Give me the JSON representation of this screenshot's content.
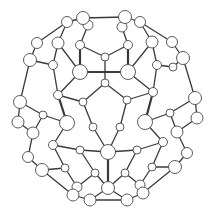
{
  "diagram": {
    "colors": {
      "background": "#ffffff",
      "bond": "#3a3a3a",
      "atom_fill": "#ffffff",
      "atom_stroke": "#4a4a4a"
    },
    "atoms": [
      [
        83,
        18,
        6.5
      ],
      [
        125,
        17,
        6.5
      ],
      [
        67,
        22,
        5.5
      ],
      [
        140,
        22,
        5.5
      ],
      [
        88,
        25,
        5
      ],
      [
        122,
        27,
        5
      ],
      [
        37,
        43,
        5.5
      ],
      [
        58,
        43,
        6
      ],
      [
        152,
        42,
        6
      ],
      [
        172,
        42,
        5.5
      ],
      [
        80,
        45,
        4.5
      ],
      [
        128,
        45,
        4.5
      ],
      [
        30,
        60,
        6.5
      ],
      [
        183,
        58,
        6.5
      ],
      [
        105,
        57,
        4
      ],
      [
        53,
        65,
        4.5
      ],
      [
        157,
        65,
        4.5
      ],
      [
        173,
        67,
        4
      ],
      [
        80,
        72,
        7.5
      ],
      [
        128,
        72,
        7.5
      ],
      [
        105,
        83,
        4
      ],
      [
        58,
        95,
        4.5
      ],
      [
        153,
        92,
        4.5
      ],
      [
        20,
        102,
        6.5
      ],
      [
        195,
        98,
        6.5
      ],
      [
        83,
        102,
        4
      ],
      [
        127,
        100,
        4
      ],
      [
        43,
        115,
        4
      ],
      [
        170,
        113,
        4
      ],
      [
        18,
        122,
        6
      ],
      [
        197,
        118,
        6
      ],
      [
        67,
        123,
        7.5
      ],
      [
        145,
        122,
        7.5
      ],
      [
        93,
        127,
        4
      ],
      [
        120,
        127,
        4
      ],
      [
        33,
        133,
        6
      ],
      [
        177,
        132,
        6
      ],
      [
        53,
        145,
        4.5
      ],
      [
        163,
        142,
        4.5
      ],
      [
        80,
        150,
        4
      ],
      [
        137,
        150,
        4
      ],
      [
        108,
        152,
        7.5
      ],
      [
        28,
        157,
        5.5
      ],
      [
        187,
        153,
        5.5
      ],
      [
        42,
        170,
        6.5
      ],
      [
        175,
        167,
        6.5
      ],
      [
        65,
        168,
        4
      ],
      [
        152,
        167,
        4
      ],
      [
        95,
        173,
        4
      ],
      [
        125,
        173,
        4
      ],
      [
        77,
        187,
        5
      ],
      [
        140,
        185,
        5
      ],
      [
        108,
        188,
        6.5
      ],
      [
        73,
        195,
        6
      ],
      [
        143,
        193,
        6
      ],
      [
        90,
        200,
        6
      ],
      [
        127,
        200,
        6
      ]
    ],
    "bonds": [
      [
        0,
        1
      ],
      [
        0,
        2
      ],
      [
        0,
        4
      ],
      [
        1,
        3
      ],
      [
        1,
        5
      ],
      [
        2,
        7
      ],
      [
        2,
        6
      ],
      [
        3,
        8
      ],
      [
        3,
        9
      ],
      [
        4,
        10
      ],
      [
        5,
        11
      ],
      [
        10,
        14
      ],
      [
        11,
        14
      ],
      [
        14,
        20
      ],
      [
        10,
        18
      ],
      [
        11,
        19
      ],
      [
        7,
        18
      ],
      [
        8,
        19
      ],
      [
        18,
        19
      ],
      [
        6,
        12
      ],
      [
        7,
        15
      ],
      [
        9,
        13
      ],
      [
        8,
        16
      ],
      [
        12,
        15
      ],
      [
        13,
        17
      ],
      [
        16,
        17
      ],
      [
        18,
        21
      ],
      [
        19,
        22
      ],
      [
        20,
        25
      ],
      [
        20,
        26
      ],
      [
        21,
        25
      ],
      [
        22,
        26
      ],
      [
        12,
        23
      ],
      [
        13,
        24
      ],
      [
        15,
        21
      ],
      [
        16,
        22
      ],
      [
        23,
        27
      ],
      [
        24,
        28
      ],
      [
        21,
        31
      ],
      [
        22,
        32
      ],
      [
        25,
        33
      ],
      [
        26,
        34
      ],
      [
        27,
        31
      ],
      [
        28,
        32
      ],
      [
        33,
        41
      ],
      [
        34,
        41
      ],
      [
        23,
        29
      ],
      [
        24,
        30
      ],
      [
        29,
        35
      ],
      [
        30,
        36
      ],
      [
        27,
        35
      ],
      [
        28,
        36
      ],
      [
        31,
        37
      ],
      [
        32,
        38
      ],
      [
        35,
        42
      ],
      [
        36,
        43
      ],
      [
        37,
        39
      ],
      [
        38,
        40
      ],
      [
        39,
        41
      ],
      [
        40,
        41
      ],
      [
        42,
        44
      ],
      [
        43,
        45
      ],
      [
        37,
        46
      ],
      [
        38,
        47
      ],
      [
        44,
        46
      ],
      [
        45,
        47
      ],
      [
        39,
        48
      ],
      [
        40,
        49
      ],
      [
        41,
        52
      ],
      [
        48,
        52
      ],
      [
        49,
        52
      ],
      [
        46,
        50
      ],
      [
        47,
        51
      ],
      [
        44,
        53
      ],
      [
        45,
        54
      ],
      [
        50,
        53
      ],
      [
        51,
        54
      ],
      [
        48,
        50
      ],
      [
        49,
        51
      ],
      [
        53,
        55
      ],
      [
        54,
        56
      ],
      [
        55,
        56
      ],
      [
        52,
        55
      ],
      [
        52,
        56
      ]
    ],
    "heavy_bonds": [
      [
        18,
        19
      ],
      [
        10,
        18
      ],
      [
        11,
        19
      ],
      [
        31,
        41
      ],
      [
        32,
        41
      ],
      [
        21,
        31
      ],
      [
        22,
        32
      ],
      [
        41,
        52
      ]
    ]
  }
}
